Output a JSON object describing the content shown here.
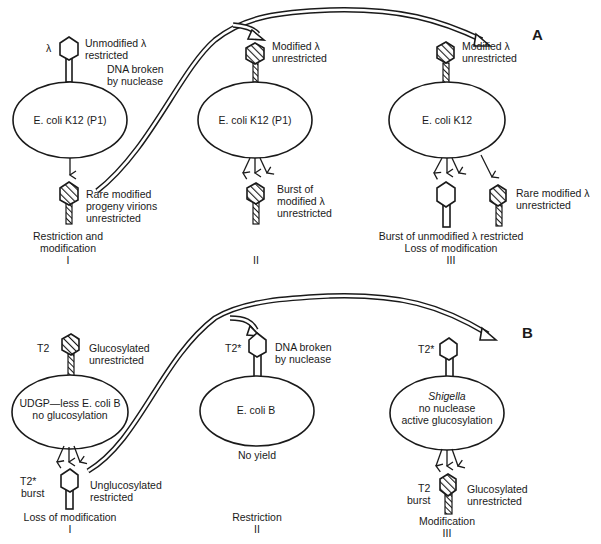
{
  "panels": {
    "A": {
      "label": "A",
      "stage1": {
        "phage_label": "λ",
        "phage_note_line1": "Unmodified λ",
        "phage_note_line2": "restricted",
        "nuclease_line1": "DNA broken",
        "nuclease_line2": "by nuclease",
        "host_italic": "E. coli",
        "host_rest": " K12 (P1)",
        "progeny_line1": "Rare modified",
        "progeny_line2": "progeny virions",
        "progeny_line3": "unrestricted",
        "caption_line1": "Restriction and",
        "caption_line2": "modification",
        "numeral": "I"
      },
      "stage2": {
        "phage_note_line1": "Modified λ",
        "phage_note_line2": "unrestricted",
        "host_italic": "E. coli",
        "host_rest": " K12 (P1)",
        "progeny_line1": "Burst of",
        "progeny_line2": "modified λ",
        "progeny_line3": "unrestricted",
        "numeral": "II"
      },
      "stage3": {
        "phage_note_line1": "Modified λ",
        "phage_note_line2": "unrestricted",
        "host_italic": "E. coli",
        "host_rest": " K12",
        "rare_line1": "Rare modified λ",
        "rare_line2": "unrestricted",
        "caption_line1": "Burst of unmodified λ restricted",
        "caption_line2": "Loss of modification",
        "numeral": "III"
      }
    },
    "B": {
      "label": "B",
      "stage1": {
        "phage_label": "T2",
        "phage_note_line1": "Glucosylated",
        "phage_note_line2": "unrestricted",
        "host_line1_plain": "UDGP—less ",
        "host_line1_italic": "E. coli",
        "host_line1_rest": " B",
        "host_line2": "no glucosylation",
        "burst_line1": "T2*",
        "burst_line2": "burst",
        "progeny_line1": "Unglucosylated",
        "progeny_line2": "restricted",
        "caption_line1": "Loss of modification",
        "numeral": "I"
      },
      "stage2": {
        "phage_label": "T2*",
        "phage_note_line1": "DNA broken",
        "phage_note_line2": "by nuclease",
        "host_italic": "E. coli",
        "host_rest": " B",
        "result": "No yield",
        "caption_line1": "Restriction",
        "numeral": "II"
      },
      "stage3": {
        "phage_label": "T2*",
        "host_line1_italic": "Shigella",
        "host_line2": "no nuclease",
        "host_line3": "active glucosylation",
        "burst_line1": "T2",
        "burst_line2": "burst",
        "progeny_line1": "Glucosylated",
        "progeny_line2": "unrestricted",
        "caption_line1": "Modification",
        "numeral": "III"
      }
    }
  },
  "icons": {
    "unmodified_phage": "open-hexagon-head-phage",
    "modified_phage": "hatched-hexagon-head-phage",
    "transfer_arrow": "double-line-curved-arrow",
    "burst_arrows": "three-down-arrows"
  }
}
